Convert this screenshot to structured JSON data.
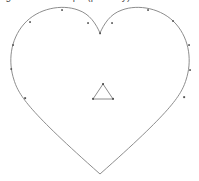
{
  "canvas": {
    "width": 199,
    "height": 181,
    "background_color": "#ffffff"
  },
  "caption": {
    "text": "figure heart shape (partially) cut",
    "note": "clipped at top edge; only descenders visible",
    "color": "#4a4a4a"
  },
  "figure": {
    "stroke_color": "#808080",
    "vertex_marker_color": "#555555",
    "fill": "none",
    "stroke_width": 0.9,
    "shapes": [
      {
        "name": "heart-outline",
        "type": "closed-path",
        "bottom_point": [
          100,
          174
        ],
        "cleft_point": [
          100,
          33
        ],
        "left_extent": 9,
        "right_extent": 192,
        "top_extent": 8
      },
      {
        "name": "inner-triangle",
        "type": "polygon",
        "points": [
          [
            103,
            84
          ],
          [
            93,
            99
          ],
          [
            113,
            99
          ]
        ],
        "vertex_count": 3
      }
    ],
    "heart_vertex_markers": [
      [
        62,
        10
      ],
      [
        30,
        22
      ],
      [
        13,
        45
      ],
      [
        11,
        69
      ],
      [
        25,
        98
      ],
      [
        88,
        23
      ],
      [
        100,
        33
      ],
      [
        112,
        23
      ],
      [
        148,
        10
      ],
      [
        173,
        21
      ],
      [
        189,
        45
      ],
      [
        190,
        70
      ],
      [
        184,
        97
      ]
    ],
    "triangle_vertex_markers": [
      [
        103,
        84
      ],
      [
        93,
        99
      ],
      [
        113,
        99
      ]
    ]
  }
}
